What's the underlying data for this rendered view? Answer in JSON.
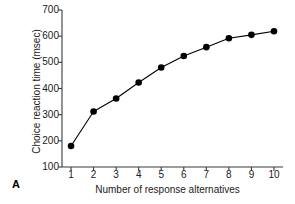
{
  "chart_data": {
    "type": "line",
    "title": "",
    "panel_label": "A",
    "xlabel": "Number of response alternatives",
    "ylabel": "Choice reaction time (msec)",
    "x": [
      1,
      2,
      3,
      4,
      5,
      6,
      7,
      8,
      9,
      10
    ],
    "values": [
      180,
      312,
      362,
      423,
      480,
      524,
      558,
      592,
      605,
      619
    ],
    "series": [
      {
        "name": "Choice reaction time",
        "values": [
          180,
          312,
          362,
          423,
          480,
          524,
          558,
          592,
          605,
          619
        ]
      }
    ],
    "xlim": [
      0.6,
      10.4
    ],
    "ylim": [
      100,
      700
    ],
    "xticks": [
      1,
      2,
      3,
      4,
      5,
      6,
      7,
      8,
      9,
      10
    ],
    "xtick_labels": [
      "1",
      "2",
      "3",
      "4",
      "5",
      "6",
      "7",
      "8",
      "9",
      "10"
    ],
    "yticks": [
      100,
      200,
      300,
      400,
      500,
      600,
      700
    ],
    "ytick_labels": [
      "100",
      "200",
      "300",
      "400",
      "500",
      "600",
      "700"
    ],
    "grid": false,
    "legend": false,
    "legend_position": "none",
    "marker": "filled-circle",
    "line_color": "#000000",
    "marker_color": "#000000",
    "background_color": "#ffffff"
  }
}
